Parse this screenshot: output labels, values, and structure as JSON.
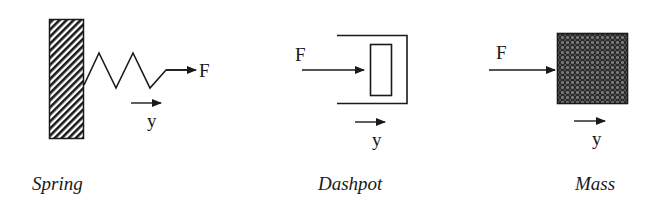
{
  "diagram": {
    "elements": [
      {
        "id": "spring",
        "caption": "Spring",
        "force_label": "F",
        "displacement_label": "y"
      },
      {
        "id": "dashpot",
        "caption": "Dashpot",
        "force_label": "F",
        "displacement_label": "y"
      },
      {
        "id": "mass",
        "caption": "Mass",
        "force_label": "F",
        "displacement_label": "y"
      }
    ],
    "colors": {
      "stroke": "#1a1a1a",
      "background": "#ffffff"
    }
  }
}
